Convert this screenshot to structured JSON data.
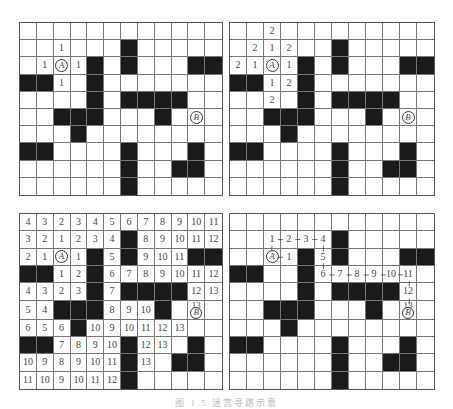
{
  "figure": {
    "rows": 10,
    "cols": 12,
    "black_cells": [
      [
        1,
        6
      ],
      [
        2,
        4
      ],
      [
        2,
        6
      ],
      [
        2,
        10
      ],
      [
        2,
        11
      ],
      [
        3,
        0
      ],
      [
        3,
        1
      ],
      [
        3,
        4
      ],
      [
        4,
        4
      ],
      [
        4,
        6
      ],
      [
        4,
        7
      ],
      [
        4,
        8
      ],
      [
        4,
        9
      ],
      [
        5,
        2
      ],
      [
        5,
        3
      ],
      [
        5,
        4
      ],
      [
        5,
        8
      ],
      [
        6,
        3
      ],
      [
        7,
        0
      ],
      [
        7,
        1
      ],
      [
        7,
        6
      ],
      [
        7,
        10
      ],
      [
        8,
        6
      ],
      [
        8,
        9
      ],
      [
        8,
        10
      ],
      [
        9,
        6
      ]
    ],
    "start": {
      "label": "A",
      "row": 2,
      "col": 2
    },
    "end": {
      "label": "B",
      "row": 5,
      "col": 10
    },
    "caption": "图 1.5 迷宫寻路示意"
  },
  "panels": [
    {
      "id": "panel-1",
      "title": "Step 1: distance 1 from A",
      "numbers": [
        {
          "row": 1,
          "col": 2,
          "value": "1"
        },
        {
          "row": 2,
          "col": 1,
          "value": "1"
        },
        {
          "row": 2,
          "col": 3,
          "value": "1"
        },
        {
          "row": 3,
          "col": 2,
          "value": "1"
        }
      ]
    },
    {
      "id": "panel-2",
      "title": "Step 2: distance 2 from A",
      "numbers": [
        {
          "row": 0,
          "col": 2,
          "value": "2"
        },
        {
          "row": 1,
          "col": 1,
          "value": "2"
        },
        {
          "row": 1,
          "col": 2,
          "value": "1"
        },
        {
          "row": 1,
          "col": 3,
          "value": "2"
        },
        {
          "row": 2,
          "col": 0,
          "value": "2"
        },
        {
          "row": 2,
          "col": 1,
          "value": "1"
        },
        {
          "row": 2,
          "col": 3,
          "value": "1"
        },
        {
          "row": 3,
          "col": 2,
          "value": "1"
        },
        {
          "row": 3,
          "col": 3,
          "value": "2"
        },
        {
          "row": 4,
          "col": 2,
          "value": "2"
        }
      ]
    },
    {
      "id": "panel-3",
      "title": "Full distance labeling",
      "grid_values": [
        [
          "4",
          "3",
          "2",
          "3",
          "4",
          "5",
          "6",
          "7",
          "8",
          "9",
          "10",
          "11"
        ],
        [
          "3",
          "2",
          "1",
          "2",
          "3",
          "4",
          "",
          "8",
          "9",
          "10",
          "11",
          "12"
        ],
        [
          "2",
          "1",
          "A",
          "1",
          "",
          "5",
          "",
          "9",
          "10",
          "11",
          "",
          ""
        ],
        [
          "",
          "",
          "1",
          "2",
          "",
          "6",
          "7",
          "8",
          "9",
          "10",
          "11",
          "12"
        ],
        [
          "4",
          "3",
          "2",
          "3",
          "",
          "7",
          "",
          "",
          "",
          "",
          "12",
          "13"
        ],
        [
          "5",
          "4",
          "",
          "",
          "",
          "8",
          "9",
          "10",
          "",
          "",
          "13|B",
          ""
        ],
        [
          "6",
          "5",
          "6",
          "",
          "10",
          "9",
          "10",
          "11",
          "12",
          "13",
          "",
          ""
        ],
        [
          "",
          "",
          "7",
          "8",
          "9",
          "10",
          "",
          "12",
          "13",
          "",
          "",
          ""
        ],
        [
          "10",
          "9",
          "8",
          "9",
          "10",
          "11",
          "",
          "13",
          "",
          "",
          "",
          ""
        ],
        [
          "11",
          "10",
          "9",
          "10",
          "11",
          "12",
          "",
          "",
          "",
          "",
          "",
          ""
        ]
      ]
    },
    {
      "id": "panel-4",
      "title": "Traceback path from B to A",
      "numbers": [
        {
          "row": 1,
          "col": 2,
          "value": "1"
        },
        {
          "row": 1,
          "col": 3,
          "value": "2"
        },
        {
          "row": 1,
          "col": 4,
          "value": "3"
        },
        {
          "row": 1,
          "col": 5,
          "value": "4"
        },
        {
          "row": 2,
          "col": 3,
          "value": "1"
        },
        {
          "row": 2,
          "col": 5,
          "value": "5"
        },
        {
          "row": 3,
          "col": 5,
          "value": "6"
        },
        {
          "row": 3,
          "col": 6,
          "value": "7"
        },
        {
          "row": 3,
          "col": 7,
          "value": "8"
        },
        {
          "row": 3,
          "col": 8,
          "value": "9"
        },
        {
          "row": 3,
          "col": 9,
          "value": "10"
        },
        {
          "row": 3,
          "col": 10,
          "value": "11"
        },
        {
          "row": 4,
          "col": 10,
          "value": "12"
        },
        {
          "row": 5,
          "col": 10,
          "value": "13",
          "with_end": true
        }
      ],
      "path": [
        [
          5,
          10
        ],
        [
          4,
          10
        ],
        [
          3,
          10
        ],
        [
          3,
          9
        ],
        [
          3,
          8
        ],
        [
          3,
          7
        ],
        [
          3,
          6
        ],
        [
          3,
          5
        ],
        [
          2,
          5
        ],
        [
          1,
          5
        ],
        [
          1,
          4
        ],
        [
          1,
          3
        ],
        [
          1,
          2
        ],
        [
          2,
          2
        ]
      ],
      "side_link": {
        "from": [
          2,
          3
        ],
        "to": [
          2,
          2
        ]
      }
    }
  ],
  "colors": {
    "wall": "#1a1a1a",
    "grid_line": "#777777",
    "text": "#444444",
    "background": "#ffffff"
  }
}
